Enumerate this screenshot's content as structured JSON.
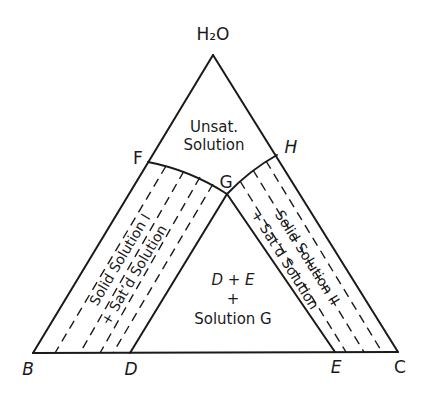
{
  "diagram": {
    "type": "ternary-phase-diagram",
    "components": {
      "top": "H₂O",
      "bottom_left": "B",
      "bottom_right": "C"
    },
    "points": {
      "B": "B",
      "C": "C",
      "D": "D",
      "E": "E",
      "F": "F",
      "G": "G",
      "H": "H",
      "apex": "H₂O"
    },
    "regions": {
      "unsaturated": {
        "line1": "Unsat.",
        "line2": "Solution"
      },
      "center": {
        "line1": "D + E",
        "line2": "+",
        "line3": "Solution G"
      },
      "left_band": {
        "line1": "Solid Solution I",
        "line2": "+ Sat’d Solution"
      },
      "right_band": {
        "line1": "Solid Solution II",
        "line2": "+ Sat’d Solution"
      }
    },
    "colors": {
      "line": "#1a1a1a",
      "background": "#ffffff"
    }
  }
}
